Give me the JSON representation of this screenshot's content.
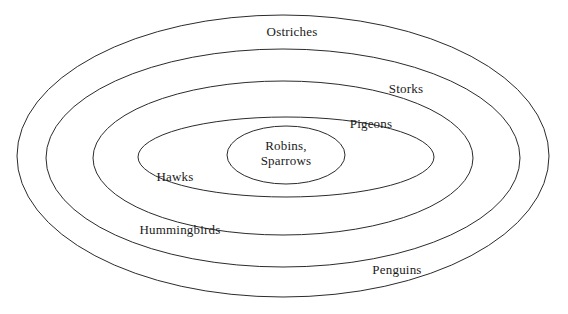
{
  "diagram": {
    "type": "nested-ellipse-venn",
    "title": "",
    "background_color": "#ffffff",
    "stroke_color": "#2b2b2b",
    "text_color": "#1a1a1a",
    "rings": [
      {
        "index": 0,
        "level": "outermost",
        "label": "Ostriches",
        "label_position": "top-center",
        "ellipse": {
          "cx": 283,
          "cy": 156,
          "rx": 266,
          "ry": 141
        }
      },
      {
        "index": 1,
        "level": "second",
        "label": "Storks",
        "label_position": "upper-right",
        "ellipse": {
          "cx": 283,
          "cy": 158,
          "rx": 237,
          "ry": 109
        }
      },
      {
        "index": 2,
        "level": "third",
        "label": "Pigeons",
        "label_position": "inner-upper-right",
        "ellipse": {
          "cx": 283,
          "cy": 158,
          "rx": 190,
          "ry": 77
        }
      },
      {
        "index": 3,
        "level": "fourth",
        "label": "Hawks",
        "label_position": "inner-left",
        "ellipse": {
          "cx": 286,
          "cy": 157,
          "rx": 148,
          "ry": 40
        }
      },
      {
        "index": 4,
        "level": "innermost",
        "label": "Robins,\nSparrows",
        "label_position": "center",
        "ellipse": {
          "cx": 286,
          "cy": 155,
          "rx": 59,
          "ry": 29
        }
      }
    ],
    "labels": [
      {
        "id": "ostriches",
        "text": "Ostriches",
        "x": 292,
        "y": 31,
        "align": "center"
      },
      {
        "id": "storks",
        "text": "Storks",
        "x": 406,
        "y": 88,
        "align": "center"
      },
      {
        "id": "pigeons",
        "text": "Pigeons",
        "x": 371,
        "y": 123,
        "align": "center"
      },
      {
        "id": "robins-sparrows-line1",
        "text": "Robins,",
        "x": 286,
        "y": 145,
        "align": "center"
      },
      {
        "id": "robins-sparrows-line2",
        "text": "Sparrows",
        "x": 286,
        "y": 160,
        "align": "center"
      },
      {
        "id": "hawks",
        "text": "Hawks",
        "x": 175,
        "y": 176,
        "align": "center"
      },
      {
        "id": "hummingbirds",
        "text": "Hummingbirds",
        "x": 180,
        "y": 229,
        "align": "center"
      },
      {
        "id": "penguins",
        "text": "Penguins",
        "x": 397,
        "y": 269,
        "align": "center"
      }
    ]
  }
}
